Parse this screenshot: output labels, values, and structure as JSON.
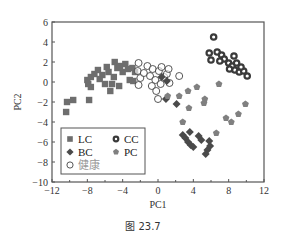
{
  "caption": "图 23.7",
  "colors": {
    "LC": "#6e6e6e",
    "BC": "#4a4a4a",
    "CC": "#3a3a3a",
    "PC": "#808080",
    "healthy": "#444444",
    "axis": "#555555"
  },
  "chart_data": {
    "type": "scatter",
    "title": "",
    "xlabel": "PC1",
    "ylabel": "PC2",
    "xlim": [
      -12,
      12
    ],
    "ylim": [
      -10,
      6
    ],
    "xticks": [
      -12,
      -8,
      -4,
      0,
      4,
      8,
      12
    ],
    "yticks": [
      6,
      4,
      2,
      0,
      -2,
      -4,
      -6,
      -8,
      -10
    ],
    "grid": false,
    "legend_position": "lower left inside",
    "legend": [
      {
        "name": "LC",
        "marker": "square"
      },
      {
        "name": "CC",
        "marker": "ring"
      },
      {
        "name": "BC",
        "marker": "diamond"
      },
      {
        "name": "PC",
        "marker": "pentagon"
      },
      {
        "name": "健康",
        "marker": "open-circle"
      }
    ],
    "series": [
      {
        "name": "LC",
        "marker": "square",
        "points": [
          [
            -10.3,
            -2.0
          ],
          [
            -9.6,
            -1.8
          ],
          [
            -10.4,
            -3.0
          ],
          [
            -7.8,
            -1.8
          ],
          [
            -8.0,
            0.2
          ],
          [
            -7.6,
            0.5
          ],
          [
            -7.2,
            0.8
          ],
          [
            -7.6,
            -0.5
          ],
          [
            -7.9,
            -0.2
          ],
          [
            -6.6,
            0.3
          ],
          [
            -6.3,
            0.7
          ],
          [
            -6.0,
            -0.2
          ],
          [
            -5.6,
            1.0
          ],
          [
            -5.2,
            -0.2
          ],
          [
            -5.0,
            0.5
          ],
          [
            -4.9,
            2.0
          ],
          [
            -4.6,
            1.4
          ],
          [
            -4.3,
            1.6
          ],
          [
            -4.0,
            1.0
          ],
          [
            -3.7,
            1.8
          ],
          [
            -3.4,
            1.3
          ],
          [
            -3.2,
            0.2
          ],
          [
            -2.9,
            1.4
          ],
          [
            -2.6,
            1.0
          ],
          [
            -2.8,
            0.1
          ],
          [
            -4.4,
            -0.4
          ],
          [
            -6.8,
            1.2
          ],
          [
            -5.8,
            1.5
          ],
          [
            -5.4,
            -0.9
          ]
        ]
      },
      {
        "name": "健康",
        "marker": "open-circle",
        "points": [
          [
            -2.2,
            1.9
          ],
          [
            -2.3,
            1.1
          ],
          [
            -2.0,
            0.4
          ],
          [
            -2.2,
            -0.3
          ],
          [
            -1.6,
            0.9
          ],
          [
            -1.2,
            1.6
          ],
          [
            -0.9,
            0.6
          ],
          [
            -0.6,
            1.3
          ],
          [
            -0.3,
            0.2
          ],
          [
            0.1,
            1.1
          ],
          [
            0.4,
            1.5
          ],
          [
            0.7,
            0.5
          ],
          [
            -0.7,
            -0.4
          ],
          [
            0.3,
            -0.2
          ],
          [
            1.0,
            0.8
          ],
          [
            -0.2,
            -0.9
          ],
          [
            1.3,
            -0.1
          ],
          [
            2.4,
            0.6
          ],
          [
            0.0,
            -1.7
          ],
          [
            1.2,
            1.3
          ]
        ]
      },
      {
        "name": "BC",
        "marker": "diamond",
        "points": [
          [
            0.4,
            0.5
          ],
          [
            1.0,
            0.1
          ],
          [
            2.1,
            -2.2
          ],
          [
            0.9,
            -1.7
          ],
          [
            2.8,
            -5.3
          ],
          [
            3.1,
            -5.6
          ],
          [
            3.4,
            -6.0
          ],
          [
            3.7,
            -6.3
          ],
          [
            4.0,
            -6.5
          ],
          [
            3.6,
            -5.0
          ],
          [
            4.6,
            -5.4
          ],
          [
            4.9,
            -5.8
          ],
          [
            5.8,
            -5.9
          ],
          [
            5.6,
            -6.8
          ],
          [
            5.4,
            -7.2
          ],
          [
            5.9,
            -6.4
          ]
        ]
      },
      {
        "name": "PC",
        "marker": "pentagon",
        "points": [
          [
            1.1,
            -1.4
          ],
          [
            2.4,
            -1.4
          ],
          [
            3.4,
            -0.9
          ],
          [
            4.4,
            -0.5
          ],
          [
            5.3,
            -1.7
          ],
          [
            2.8,
            -4.0
          ],
          [
            5.2,
            -2.1
          ],
          [
            6.9,
            -0.2
          ],
          [
            9.9,
            -2.2
          ],
          [
            6.6,
            -5.1
          ],
          [
            7.7,
            -3.6
          ],
          [
            9.1,
            -3.2
          ],
          [
            3.5,
            -2.6
          ],
          [
            8.3,
            -4.0
          ]
        ]
      },
      {
        "name": "CC",
        "marker": "ring",
        "points": [
          [
            6.3,
            4.5
          ],
          [
            5.8,
            2.9
          ],
          [
            6.7,
            3.0
          ],
          [
            7.2,
            2.7
          ],
          [
            6.0,
            2.2
          ],
          [
            7.5,
            2.3
          ],
          [
            8.0,
            1.9
          ],
          [
            8.6,
            2.6
          ],
          [
            8.4,
            1.6
          ],
          [
            8.9,
            1.9
          ],
          [
            8.7,
            1.2
          ],
          [
            9.2,
            1.0
          ],
          [
            9.7,
            1.1
          ],
          [
            10.1,
            0.6
          ],
          [
            8.1,
            1.3
          ],
          [
            7.0,
            2.1
          ],
          [
            9.4,
            1.5
          ]
        ]
      }
    ]
  }
}
